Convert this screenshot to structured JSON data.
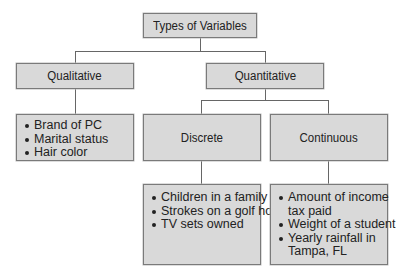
{
  "diagram": {
    "root": {
      "label": "Types of Variables"
    },
    "qualitative": {
      "label": "Qualitative",
      "examples": [
        "Brand of PC",
        "Marital status",
        "Hair color"
      ]
    },
    "quantitative": {
      "label": "Quantitative",
      "discrete": {
        "label": "Discrete",
        "examples": [
          "Children in a family",
          "Strokes on a golf hole",
          "TV sets owned"
        ]
      },
      "continuous": {
        "label": "Continuous",
        "examples": [
          "Amount of income tax paid",
          "Weight of a student",
          "Yearly rainfall in Tampa, FL"
        ],
        "example_lines": [
          [
            "Amount of income",
            "tax paid"
          ],
          [
            "Weight of a student"
          ],
          [
            "Yearly rainfall in",
            "Tampa, FL"
          ]
        ]
      }
    }
  },
  "colors": {
    "box_fill": "#d9d9d9",
    "box_border": "#7a7a7a",
    "connector": "#666666"
  }
}
